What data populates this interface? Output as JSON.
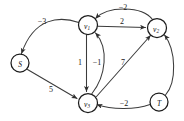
{
  "figure": {
    "kind": "directed-weighted-graph",
    "background_color": "#ffffff",
    "edge_color": "#3b3b3b",
    "node_fill": "#ffffff",
    "node_stroke": "#1c1c1c"
  },
  "nodes": [
    {
      "id": "S",
      "label": "S",
      "sub": "",
      "cx": 20,
      "cy": 63,
      "r": 9
    },
    {
      "id": "v1",
      "label": "v",
      "sub": "1",
      "cx": 88,
      "cy": 25,
      "r": 9.5
    },
    {
      "id": "v2",
      "label": "v",
      "sub": "2",
      "cx": 157,
      "cy": 28,
      "r": 9.5
    },
    {
      "id": "v3",
      "label": "v",
      "sub": "3",
      "cx": 88,
      "cy": 103,
      "r": 9.5
    },
    {
      "id": "T",
      "label": "T",
      "sub": "",
      "cx": 159,
      "cy": 102,
      "r": 9
    }
  ],
  "edges": [
    {
      "id": "e-v1-s",
      "from": "v1",
      "to": "S",
      "weight": "−3",
      "lx": 42,
      "ly": 21,
      "shape": "curve"
    },
    {
      "id": "e-v2-v1",
      "from": "v2",
      "to": "v1",
      "weight": "−2",
      "lx": 123,
      "ly": 7,
      "shape": "curve"
    },
    {
      "id": "e-v1-v2",
      "from": "v1",
      "to": "v2",
      "weight": "2",
      "lx": 122,
      "ly": 21,
      "shape": "straight"
    },
    {
      "id": "e-v1-v3",
      "from": "v1",
      "to": "v3",
      "weight": "1",
      "lx": 80,
      "ly": 62,
      "shape": "straight"
    },
    {
      "id": "e-v3-v1",
      "from": "v3",
      "to": "v1",
      "weight": "−1",
      "lx": 97,
      "ly": 62,
      "shape": "curve"
    },
    {
      "id": "e-s-v3",
      "from": "S",
      "to": "v3",
      "weight": "5",
      "lx": 51,
      "ly": 89,
      "shape": "straight"
    },
    {
      "id": "e-v3-v2",
      "from": "v3",
      "to": "v2",
      "weight": "7",
      "lx": 123,
      "ly": 62,
      "shape": "straight"
    },
    {
      "id": "e-t-v3",
      "from": "T",
      "to": "v3",
      "weight": "−2",
      "lx": 124,
      "ly": 103,
      "shape": "curve"
    },
    {
      "id": "e-t-v2",
      "from": "T",
      "to": "v2",
      "weight": "",
      "lx": 0,
      "ly": 0,
      "shape": "curve"
    }
  ]
}
